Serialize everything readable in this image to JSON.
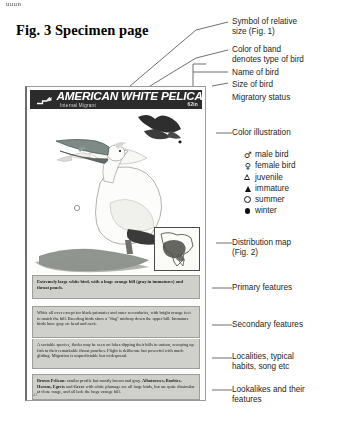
{
  "stray_text": "uuun",
  "figure": {
    "title": "Fig. 3  Specimen page"
  },
  "specimen": {
    "band": {
      "bird_name": "AMERICAN WHITE PELICAN",
      "migratory_status": "Internal Migrant",
      "size": "62in",
      "size_symbol_icon": "relative-size-symbol"
    },
    "illustration_caption": "color-illustration-of-american-white-pelican",
    "distribution_map_icon": "north-america-distribution-map",
    "primary_features": "Extremely large white bird, with a huge orange bill (gray in immatures) and throat pouch.",
    "secondary_features": "White all over except for black primaries and outer secondaries, with bright orange feet to match the bill. Breeding birds show a \"flag\" midway down the upper bill. Immature birds have gray on head and neck.",
    "habits": "A sociable species, flocks may be seen on lakes dipping their bills in unison, scooping up fish in their remarkable throat pouches. Flight is deliberate but powerful with much gliding. Migration is unpredictable but widespread.",
    "lookalikes_lead": "Brown Pelican",
    "lookalikes_rest": ": similar profile but mostly brown and gray. ",
    "lookalikes_bold2": "Albatrosses, Boobies, Herons, Egrets",
    "lookalikes_mid": " and ",
    "lookalikes_bold3": "Geese",
    "lookalikes_tail": " with white plumage are all large birds, but are quite dissimilar at close range, and all lack the huge orange bill.",
    "page_number": "42"
  },
  "annotations": [
    {
      "id": "relative-size",
      "text": "Symbol of relative\nsize (Fig. 1)"
    },
    {
      "id": "band-color",
      "text": "Color of band\ndenotes type of bird"
    },
    {
      "id": "bird-name",
      "text": "Name of bird"
    },
    {
      "id": "bird-size",
      "text": "Size of bird"
    },
    {
      "id": "migratory",
      "text": "Migratory status"
    },
    {
      "id": "illustration",
      "text": "Color illustration"
    },
    {
      "id": "dist-map",
      "text": "Distribution map\n(Fig. 2)"
    },
    {
      "id": "primary",
      "text": "Primary features"
    },
    {
      "id": "secondary",
      "text": "Secondary features"
    },
    {
      "id": "localities",
      "text": "Localities, typical\nhabits, song etc"
    },
    {
      "id": "lookalikes",
      "text": "Lookalikes and their\nfeatures"
    }
  ],
  "symbol_legend": [
    {
      "symbol": "♂",
      "kind": "glyph",
      "label": "male bird"
    },
    {
      "symbol": "♀",
      "kind": "glyph",
      "label": "female bird"
    },
    {
      "symbol": "",
      "kind": "tri-open",
      "label": "juvenile"
    },
    {
      "symbol": "",
      "kind": "tri-fill",
      "label": "immature"
    },
    {
      "symbol": "",
      "kind": "circ-open",
      "label": "summer"
    },
    {
      "symbol": "",
      "kind": "circ-fill",
      "label": "winter"
    }
  ],
  "colors": {
    "band_background": "#2b2b2b",
    "textbox_background": "#cfcfcc",
    "page_background": "#fdfdfb",
    "ink": "#1e1e1e"
  }
}
